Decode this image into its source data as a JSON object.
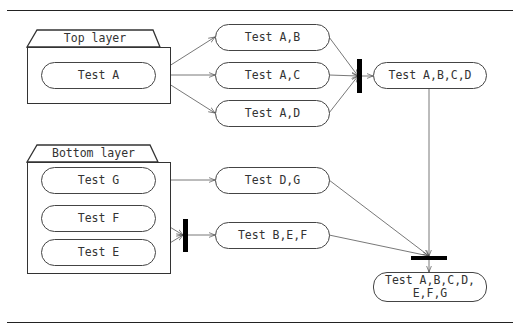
{
  "diagram": {
    "type": "activity-diagram",
    "groups": [
      {
        "id": "top",
        "label": "Top layer"
      },
      {
        "id": "bottom",
        "label": "Bottom layer"
      }
    ],
    "nodes": {
      "test_a": "Test A",
      "test_ab": "Test A,B",
      "test_ac": "Test A,C",
      "test_ad": "Test A,D",
      "test_abcd": "Test A,B,C,D",
      "test_g": "Test G",
      "test_f": "Test F",
      "test_e": "Test E",
      "test_dg": "Test D,G",
      "test_bef": "Test B,E,F",
      "test_all": "Test A,B,C,D,\nE,F,G"
    },
    "edges": [
      [
        "Test A",
        "Test A,B"
      ],
      [
        "Test A",
        "Test A,C"
      ],
      [
        "Test A",
        "Test A,D"
      ],
      [
        "Test A,B",
        "join-1"
      ],
      [
        "Test A,C",
        "join-1"
      ],
      [
        "Test A,D",
        "join-1"
      ],
      [
        "join-1",
        "Test A,B,C,D"
      ],
      [
        "Test G",
        "Test D,G"
      ],
      [
        "Test F",
        "join-2"
      ],
      [
        "Test E",
        "join-2"
      ],
      [
        "join-2",
        "Test B,E,F"
      ],
      [
        "Test A,B,C,D",
        "join-3"
      ],
      [
        "Test D,G",
        "join-3"
      ],
      [
        "Test B,E,F",
        "join-3"
      ],
      [
        "join-3",
        "Test A,B,C,D,E,F,G"
      ]
    ]
  }
}
